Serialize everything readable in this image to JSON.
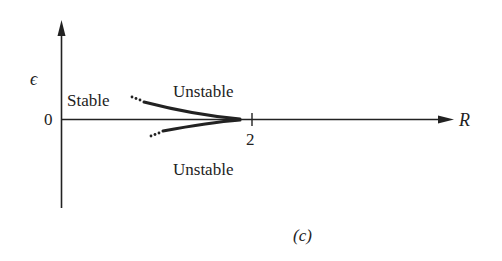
{
  "figure": {
    "panel_label": "(c)",
    "y_axis_label": "ϵ",
    "x_axis_label": "R",
    "origin_label": "0",
    "tick_label": "2",
    "region_labels": {
      "stable": "Stable",
      "unstable_upper": "Unstable",
      "unstable_lower": "Unstable"
    },
    "colors": {
      "ink": "#222222",
      "background": "#ffffff"
    }
  }
}
